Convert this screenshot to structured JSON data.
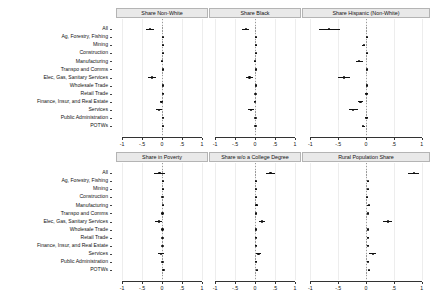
{
  "chart_data": {
    "type": "scatter",
    "plot_style": "coefficient-forest-plot-grid",
    "title": "",
    "xlabel": "",
    "ylabel": "",
    "xlim": [
      -1.15,
      1.15
    ],
    "xticks": [
      -1,
      -0.5,
      0,
      0.5,
      1
    ],
    "xticklabels": [
      "-1",
      "-.5",
      "0",
      ".5",
      "1"
    ],
    "grid": true,
    "zero_reference_line": 0,
    "layout": {
      "rows": 2,
      "cols": 3,
      "shared_y_categories": true,
      "legend": "none"
    },
    "categories": [
      "All",
      "Ag, Forestry, Fishing",
      "Mining",
      "Construction",
      "Manufacturing",
      "Transpo and Comms",
      "Elec, Gas, Sanitary Services",
      "Wholesale Trade",
      "Retail Trade",
      "Finance, Insur, and Real Estate",
      "Services",
      "Public Administration",
      "POTWs"
    ],
    "panels": [
      {
        "title": "Share Non-White",
        "row": 0,
        "col": 0,
        "estimates": [
          -0.3,
          0.03,
          0.03,
          0.03,
          0.0,
          0.03,
          -0.25,
          0.03,
          0.02,
          -0.01,
          -0.07,
          0.02,
          0.02
        ],
        "ci_low": [
          -0.4,
          0.01,
          0.01,
          0.01,
          -0.03,
          0.01,
          -0.36,
          0.01,
          0.0,
          -0.04,
          -0.14,
          0.0,
          0.0
        ],
        "ci_high": [
          -0.21,
          0.05,
          0.05,
          0.05,
          0.03,
          0.05,
          -0.16,
          0.05,
          0.04,
          0.02,
          -0.01,
          0.04,
          0.04
        ]
      },
      {
        "title": "Share Black",
        "row": 0,
        "col": 1,
        "estimates": [
          -0.23,
          0.02,
          0.02,
          0.02,
          0.0,
          0.02,
          -0.14,
          0.02,
          0.01,
          0.0,
          -0.1,
          0.01,
          0.01
        ],
        "ci_low": [
          -0.32,
          0.0,
          0.0,
          0.0,
          -0.03,
          0.0,
          -0.23,
          0.0,
          -0.01,
          -0.03,
          -0.17,
          -0.01,
          -0.01
        ],
        "ci_high": [
          -0.15,
          0.04,
          0.04,
          0.04,
          0.03,
          0.04,
          -0.06,
          0.04,
          0.03,
          0.03,
          -0.03,
          0.03,
          0.03
        ]
      },
      {
        "title": "Share Hispanic (Non-White)",
        "row": 0,
        "col": 2,
        "estimates": [
          -0.66,
          0.02,
          -0.04,
          0.02,
          -0.12,
          0.02,
          -0.39,
          0.02,
          0.01,
          -0.1,
          -0.23,
          0.01,
          -0.05
        ],
        "ci_low": [
          -0.85,
          0.0,
          -0.07,
          0.0,
          -0.18,
          0.0,
          -0.5,
          0.0,
          -0.01,
          -0.14,
          -0.31,
          -0.01,
          -0.08
        ],
        "ci_high": [
          -0.47,
          0.04,
          -0.01,
          0.04,
          -0.06,
          0.04,
          -0.28,
          0.04,
          0.03,
          -0.06,
          -0.15,
          0.03,
          -0.02
        ]
      },
      {
        "title": "Share in Poverty",
        "row": 1,
        "col": 0,
        "estimates": [
          -0.06,
          0.02,
          0.02,
          0.01,
          0.02,
          0.01,
          -0.08,
          0.01,
          0.01,
          0.01,
          -0.03,
          0.01,
          0.04
        ],
        "ci_low": [
          -0.19,
          0.0,
          0.0,
          -0.01,
          0.0,
          -0.01,
          -0.17,
          -0.01,
          -0.01,
          -0.01,
          -0.11,
          -0.01,
          0.02
        ],
        "ci_high": [
          0.07,
          0.04,
          0.04,
          0.03,
          0.04,
          0.03,
          0.01,
          0.03,
          0.03,
          0.03,
          0.05,
          0.03,
          0.06
        ]
      },
      {
        "title": "Share w/o a College Degree",
        "row": 1,
        "col": 1,
        "estimates": [
          0.39,
          0.02,
          0.02,
          0.02,
          0.04,
          0.02,
          0.18,
          0.02,
          0.02,
          0.02,
          0.09,
          0.02,
          0.05
        ],
        "ci_low": [
          0.28,
          0.0,
          0.0,
          0.0,
          0.01,
          0.0,
          0.1,
          0.0,
          0.0,
          0.0,
          0.02,
          0.0,
          0.03
        ],
        "ci_high": [
          0.5,
          0.04,
          0.04,
          0.04,
          0.07,
          0.04,
          0.26,
          0.04,
          0.04,
          0.04,
          0.16,
          0.04,
          0.07
        ]
      },
      {
        "title": "Rural Population Share",
        "row": 1,
        "col": 2,
        "estimates": [
          0.86,
          0.03,
          0.03,
          0.02,
          0.05,
          0.03,
          0.39,
          0.03,
          0.03,
          0.03,
          0.12,
          0.03,
          0.06
        ],
        "ci_low": [
          0.75,
          0.01,
          0.01,
          0.0,
          0.02,
          0.01,
          0.31,
          0.01,
          0.01,
          0.01,
          0.06,
          0.01,
          0.04
        ],
        "ci_high": [
          0.96,
          0.05,
          0.05,
          0.04,
          0.08,
          0.05,
          0.47,
          0.05,
          0.05,
          0.05,
          0.18,
          0.05,
          0.08
        ]
      }
    ]
  }
}
